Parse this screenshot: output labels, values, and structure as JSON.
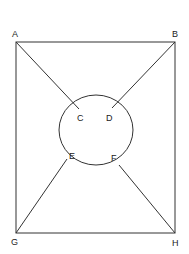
{
  "diagram": {
    "stroke_color": "#333333",
    "background": "#ffffff",
    "points": {
      "A": {
        "label": "A"
      },
      "B": {
        "label": "B"
      },
      "C": {
        "label": "C"
      },
      "D": {
        "label": "D"
      },
      "E": {
        "label": "E"
      },
      "F": {
        "label": "F"
      },
      "G": {
        "label": "G"
      },
      "H": {
        "label": "H"
      }
    },
    "edges": [
      [
        "A",
        "B"
      ],
      [
        "B",
        "H"
      ],
      [
        "H",
        "G"
      ],
      [
        "G",
        "A"
      ],
      [
        "A",
        "C"
      ],
      [
        "B",
        "D"
      ],
      [
        "G",
        "E"
      ],
      [
        "H",
        "F"
      ]
    ],
    "shapes": [
      "rectangle ABHG",
      "circle through C, D, E, F"
    ]
  }
}
